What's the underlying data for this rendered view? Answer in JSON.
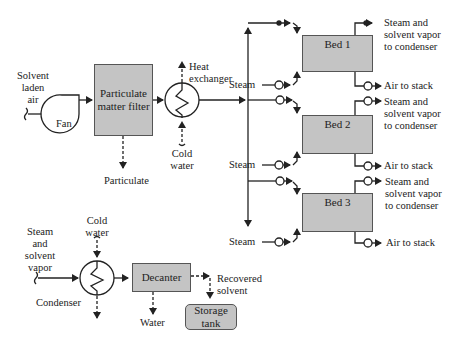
{
  "diagram": {
    "inputs": {
      "solvent_laden_air": [
        "Solvent",
        "laden",
        "air"
      ],
      "steam_solvent_vapor": [
        "Steam",
        "and",
        "solvent",
        "vapor"
      ]
    },
    "equipment": {
      "fan": "Fan",
      "filter": [
        "Particulate",
        "matter filter"
      ],
      "heat_exchanger": [
        "Heat",
        "exchanger"
      ],
      "cold_water_top": [
        "Cold",
        "water"
      ],
      "cold_water_bottom": [
        "Cold",
        "water"
      ],
      "particulate": "Particulate",
      "condenser": "Condenser",
      "decanter": "Decanter",
      "water": "Water",
      "recovered_solvent": [
        "Recovered",
        "solvent"
      ],
      "storage_tank": [
        "Storage",
        "tank"
      ]
    },
    "beds": [
      {
        "label": "Bed 1",
        "steam": "Steam",
        "out_top": [
          "Steam and",
          "solvent vapor",
          "to condenser"
        ],
        "out_bottom": "Air to stack"
      },
      {
        "label": "Bed 2",
        "steam": "Steam",
        "out_top": [
          "Steam and",
          "solvent vapor",
          "to condenser"
        ],
        "out_bottom": "Air to stack"
      },
      {
        "label": "Bed 3",
        "steam": "Steam",
        "out_top": [
          "Steam and",
          "solvent vapor",
          "to condenser"
        ],
        "out_bottom": "Air to stack"
      }
    ],
    "colors": {
      "box_fill": "#c4c4c4",
      "line": "#222222"
    }
  }
}
